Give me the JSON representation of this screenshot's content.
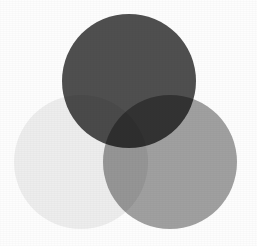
{
  "figure": {
    "background_color": "#fdfdfd",
    "width": 257,
    "height": 246
  },
  "chart_data": {
    "type": "venn",
    "subtitle": "",
    "xlabel": "",
    "ylabel": "",
    "grid": false,
    "legend_position": "none",
    "background_color": "#fdfdfd",
    "blend_mode": "multiply",
    "canvas": {
      "width": 257,
      "height": 246
    },
    "xlim": [
      0,
      257
    ],
    "ylim": [
      0,
      246
    ],
    "sets": [
      {
        "name": "top",
        "label": "",
        "cx": 129,
        "cy": 81,
        "r": 67,
        "color": "#4f4f4f",
        "opacity": 1,
        "z": 3
      },
      {
        "name": "left",
        "label": "",
        "cx": 81,
        "cy": 162,
        "r": 67,
        "color": "#ededed",
        "opacity": 1,
        "z": 1
      },
      {
        "name": "right",
        "label": "",
        "cx": 170,
        "cy": 162,
        "r": 67,
        "color": "#a0a0a0",
        "opacity": 1,
        "z": 2
      }
    ],
    "intersection_colors": {
      "top_right": "#2b2b2b",
      "top_left": "#4b4b4b",
      "left_right": "#9b9b9b",
      "all_three": "#2a2a2a"
    }
  }
}
